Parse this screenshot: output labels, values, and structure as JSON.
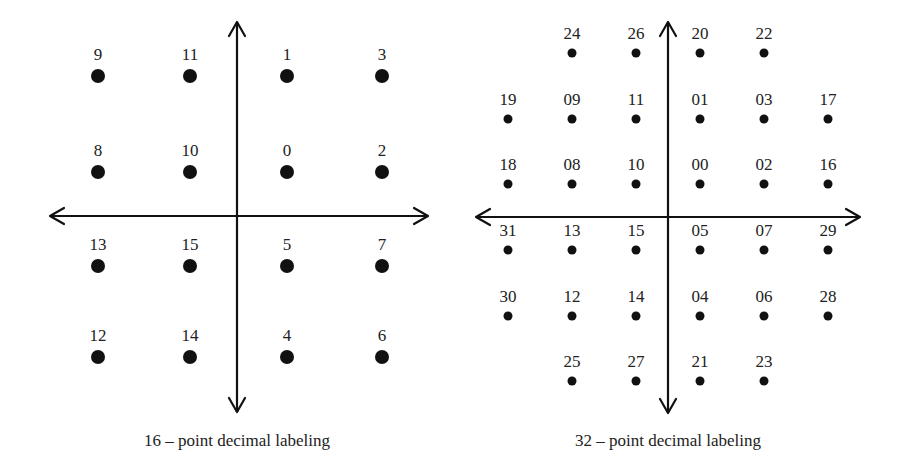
{
  "diagrams": [
    {
      "id": "qam16",
      "caption": "16 – point decimal labeling",
      "axes": {
        "cx": 237,
        "cy": 216,
        "x_from": 50,
        "x_to": 428,
        "y_from": 22,
        "y_to": 412
      },
      "point_radius": 7,
      "label_offset": 22,
      "points": [
        {
          "label": "9",
          "x": 98,
          "y": 76
        },
        {
          "label": "11",
          "x": 190,
          "y": 76
        },
        {
          "label": "1",
          "x": 287,
          "y": 76
        },
        {
          "label": "3",
          "x": 382,
          "y": 76
        },
        {
          "label": "8",
          "x": 98,
          "y": 172
        },
        {
          "label": "10",
          "x": 190,
          "y": 172
        },
        {
          "label": "0",
          "x": 287,
          "y": 172
        },
        {
          "label": "2",
          "x": 382,
          "y": 172
        },
        {
          "label": "13",
          "x": 98,
          "y": 266
        },
        {
          "label": "15",
          "x": 190,
          "y": 266
        },
        {
          "label": "5",
          "x": 287,
          "y": 266
        },
        {
          "label": "7",
          "x": 382,
          "y": 266
        },
        {
          "label": "12",
          "x": 98,
          "y": 357
        },
        {
          "label": "14",
          "x": 190,
          "y": 357
        },
        {
          "label": "4",
          "x": 287,
          "y": 357
        },
        {
          "label": "6",
          "x": 382,
          "y": 357
        }
      ]
    },
    {
      "id": "qam32",
      "caption": "32 – point decimal labeling",
      "axes": {
        "cx": 668,
        "cy": 217,
        "x_from": 476,
        "x_to": 860,
        "y_from": 22,
        "y_to": 413
      },
      "point_radius": 4.5,
      "label_offset": 20,
      "points": [
        {
          "label": "24",
          "x": 572,
          "y": 53
        },
        {
          "label": "26",
          "x": 636,
          "y": 53
        },
        {
          "label": "20",
          "x": 700,
          "y": 53
        },
        {
          "label": "22",
          "x": 764,
          "y": 53
        },
        {
          "label": "19",
          "x": 508,
          "y": 119
        },
        {
          "label": "09",
          "x": 572,
          "y": 119
        },
        {
          "label": "11",
          "x": 636,
          "y": 119
        },
        {
          "label": "01",
          "x": 700,
          "y": 119
        },
        {
          "label": "03",
          "x": 764,
          "y": 119
        },
        {
          "label": "17",
          "x": 828,
          "y": 119
        },
        {
          "label": "18",
          "x": 508,
          "y": 184
        },
        {
          "label": "08",
          "x": 572,
          "y": 184
        },
        {
          "label": "10",
          "x": 636,
          "y": 184
        },
        {
          "label": "00",
          "x": 700,
          "y": 184
        },
        {
          "label": "02",
          "x": 764,
          "y": 184
        },
        {
          "label": "16",
          "x": 828,
          "y": 184
        },
        {
          "label": "31",
          "x": 508,
          "y": 250
        },
        {
          "label": "13",
          "x": 572,
          "y": 250
        },
        {
          "label": "15",
          "x": 636,
          "y": 250
        },
        {
          "label": "05",
          "x": 700,
          "y": 250
        },
        {
          "label": "07",
          "x": 764,
          "y": 250
        },
        {
          "label": "29",
          "x": 828,
          "y": 250
        },
        {
          "label": "30",
          "x": 508,
          "y": 316
        },
        {
          "label": "12",
          "x": 572,
          "y": 316
        },
        {
          "label": "14",
          "x": 636,
          "y": 316
        },
        {
          "label": "04",
          "x": 700,
          "y": 316
        },
        {
          "label": "06",
          "x": 764,
          "y": 316
        },
        {
          "label": "28",
          "x": 828,
          "y": 316
        },
        {
          "label": "25",
          "x": 572,
          "y": 381
        },
        {
          "label": "27",
          "x": 636,
          "y": 381
        },
        {
          "label": "21",
          "x": 700,
          "y": 381
        },
        {
          "label": "23",
          "x": 764,
          "y": 381
        }
      ]
    }
  ],
  "colors": {
    "ink": "#111111",
    "text": "#222222",
    "background": "#ffffff"
  }
}
